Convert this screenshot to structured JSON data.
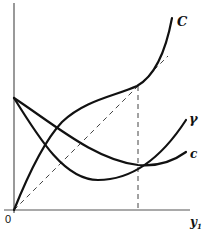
{
  "diagram": {
    "type": "economic-curves",
    "axes": {
      "origin_label": "0",
      "x_label": "y",
      "x_label_subscript": "1"
    },
    "curves": [
      {
        "id": "C",
        "label": "C",
        "style": "solid",
        "description": "convex rising curve from origin, steep at end"
      },
      {
        "id": "gamma",
        "label": "γ",
        "style": "solid",
        "description": "U-shaped curve, falls from y-axis then rises"
      },
      {
        "id": "c",
        "label": "c",
        "style": "solid",
        "description": "shallow U-shaped curve, falls from y-axis then flattens"
      },
      {
        "id": "diagonal",
        "label": "",
        "style": "dashed",
        "description": "45-degree ray from origin"
      },
      {
        "id": "vertical",
        "label": "",
        "style": "dashed",
        "description": "vertical line at intersection of γ and c, touching C on the diagonal"
      }
    ]
  }
}
